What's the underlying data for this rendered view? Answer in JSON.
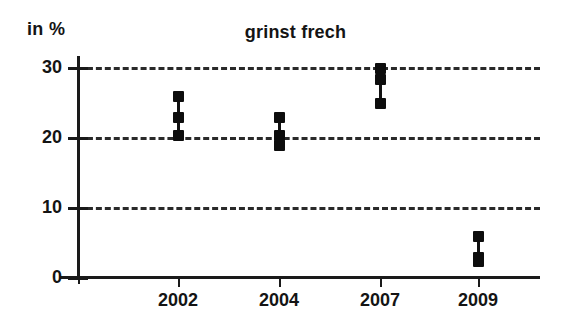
{
  "chart_data": {
    "type": "scatter",
    "title": "grinst frech",
    "subtitle": "",
    "xlabel": "",
    "ylabel": "in %",
    "unit_label": "in %",
    "categories": [
      "2002",
      "2004",
      "2007",
      "2009"
    ],
    "ylim": [
      0,
      32
    ],
    "xlim": [
      0,
      5
    ],
    "y_ticks": [
      0,
      10,
      20,
      30
    ],
    "y_tick_labels": [
      "0",
      "10",
      "20",
      "30"
    ],
    "grid": true,
    "grid_axis": "y",
    "grid_style": "dashed",
    "legend": false,
    "legend_position": "none",
    "marker": "square",
    "marker_color": "#0d0d0d",
    "line_color": "#111111",
    "axis_color": "#1a1a1a",
    "background": "#ffffff",
    "series": [
      {
        "name": "max",
        "values": [
          26.0,
          23.0,
          30.0,
          6.0
        ]
      },
      {
        "name": "mid",
        "values": [
          23.0,
          20.5,
          28.5,
          3.0
        ]
      },
      {
        "name": "min",
        "values": [
          20.5,
          19.0,
          25.0,
          2.5
        ]
      }
    ],
    "groups": [
      {
        "category": "2002",
        "x_index": 0,
        "max": 26.0,
        "mid": 23.0,
        "min": 20.5
      },
      {
        "category": "2004",
        "x_index": 1,
        "max": 23.0,
        "mid": 20.5,
        "min": 19.0
      },
      {
        "category": "2007",
        "x_index": 2,
        "max": 30.0,
        "mid": 28.5,
        "min": 25.0
      },
      {
        "category": "2009",
        "x_index": 3,
        "max": 6.0,
        "mid": 3.0,
        "min": 2.5
      }
    ],
    "annotations": []
  },
  "geometry": {
    "y_axis_x": 78,
    "x_axis_y": 277,
    "value_zero_y": 278,
    "px_per_unit": 7.0,
    "category_x": [
      178,
      279,
      380,
      478
    ]
  }
}
